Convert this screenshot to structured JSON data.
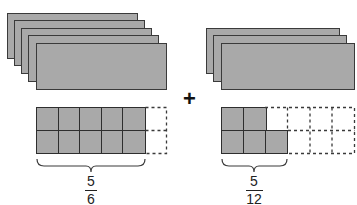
{
  "diagram": {
    "operator": "+",
    "left": {
      "whole_cards": 5,
      "grid": {
        "rows": 2,
        "cols": 6,
        "filled_cells": 10
      },
      "fraction": {
        "numerator": "5",
        "denominator": "6"
      }
    },
    "right": {
      "whole_cards": 3,
      "grid": {
        "rows": 2,
        "cols": 6,
        "filled_cells": 5
      },
      "fraction": {
        "numerator": "5",
        "denominator": "12"
      }
    },
    "colors": {
      "fill": "#a9a9a9",
      "stroke": "#3a3a3a",
      "background": "#ffffff"
    }
  }
}
